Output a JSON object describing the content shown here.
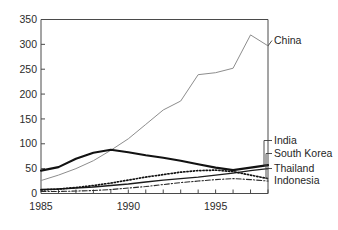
{
  "chart_data": {
    "type": "line",
    "title": "",
    "subtitle": "",
    "xlabel": "",
    "ylabel": "",
    "xlim": [
      1985,
      1998
    ],
    "ylim": [
      0,
      350
    ],
    "grid": false,
    "legend_position": "right-inline-labels",
    "y_ticks": [
      0,
      50,
      100,
      150,
      200,
      250,
      300,
      350
    ],
    "y_tick_labels": [
      "0",
      "50",
      "100",
      "150",
      "200",
      "250",
      "300",
      "350"
    ],
    "x_ticks": [
      1985,
      1986,
      1987,
      1988,
      1989,
      1990,
      1991,
      1992,
      1993,
      1994,
      1995,
      1996,
      1997,
      1998
    ],
    "x_tick_labels_shown": [
      "1985",
      "1990",
      "1995"
    ],
    "x_labeled_ticks": [
      1985,
      1990,
      1995
    ],
    "x": [
      1985,
      1986,
      1987,
      1988,
      1989,
      1990,
      1991,
      1992,
      1993,
      1994,
      1995,
      1996,
      1997,
      1998
    ],
    "series": [
      {
        "name": "China",
        "style": "solid-thin",
        "color": "#8d8d8d",
        "width": 1.0,
        "values": [
          26,
          37,
          50,
          66,
          87,
          110,
          139,
          168,
          186,
          239,
          243,
          252,
          319,
          297
        ]
      },
      {
        "name": "India",
        "style": "solid-thick",
        "color": "#121212",
        "width": 2.1,
        "values": [
          46,
          53,
          70,
          82,
          88,
          83,
          77,
          72,
          66,
          59,
          52,
          47,
          52,
          57
        ]
      },
      {
        "name": "South Korea",
        "style": "solid-medium",
        "color": "#1c1c1c",
        "width": 1.4,
        "values": [
          8,
          9,
          11,
          13,
          16,
          19,
          23,
          27,
          30,
          33,
          37,
          41,
          46,
          50
        ]
      },
      {
        "name": "Thailand",
        "style": "dotted",
        "color": "#111111",
        "width": 1.7,
        "values": [
          7,
          9,
          12,
          16,
          21,
          27,
          33,
          38,
          43,
          46,
          47,
          44,
          37,
          30
        ]
      },
      {
        "name": "Indonesia",
        "style": "dash-dot",
        "color": "#2a2a2a",
        "width": 1.1,
        "values": [
          4,
          4,
          5,
          6,
          8,
          11,
          14,
          18,
          22,
          25,
          28,
          30,
          28,
          25
        ]
      }
    ],
    "annotations": [
      {
        "text": "China",
        "for": "China"
      },
      {
        "text": "India",
        "for": "India"
      },
      {
        "text": "South Korea",
        "for": "South Korea"
      },
      {
        "text": "Thailand",
        "for": "Thailand"
      },
      {
        "text": "Indonesia",
        "for": "Indonesia"
      }
    ]
  }
}
